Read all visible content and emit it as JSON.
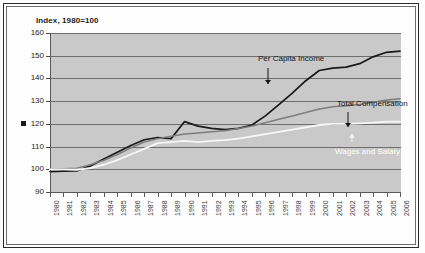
{
  "chart_data": {
    "type": "line",
    "title": "",
    "axis_title": "Index, 1980=100",
    "xlabel": "",
    "ylabel": "Index, 1980=100",
    "ylim": [
      90,
      160
    ],
    "ytick_step": 10,
    "yticks": [
      160,
      150,
      140,
      130,
      120,
      110,
      100,
      90
    ],
    "grid": true,
    "legend_position": "inline-annotations",
    "x": [
      1980,
      1981,
      1982,
      1983,
      1984,
      1985,
      1986,
      1987,
      1988,
      1989,
      1990,
      1991,
      1992,
      1993,
      1994,
      1995,
      1996,
      1997,
      1998,
      1999,
      2000,
      2001,
      2002,
      2003,
      2004,
      2005,
      2006
    ],
    "categories": [
      "1980",
      "1981",
      "1982",
      "1983",
      "1984",
      "1985",
      "1986",
      "1987",
      "1988",
      "1989",
      "1990",
      "1991",
      "1992",
      "1993",
      "1994",
      "1995",
      "1996",
      "1997",
      "1998",
      "1999",
      "2000",
      "2001",
      "2002",
      "2003",
      "2004",
      "2005",
      "2006"
    ],
    "series": [
      {
        "name": "Per Capita Income",
        "color": "#1a1a1a",
        "values": [
          99.0,
          99.2,
          99.3,
          101.5,
          104.5,
          107.5,
          110.5,
          113.0,
          114.0,
          113.5,
          121.0,
          119.0,
          118.0,
          117.5,
          118.0,
          119.5,
          123.5,
          128.5,
          133.5,
          139.0,
          143.5,
          144.5,
          145.0,
          146.5,
          149.5,
          151.5,
          152.0
        ]
      },
      {
        "name": "Total Compensation",
        "color": "#7d7d7d",
        "values": [
          100.0,
          100.2,
          100.5,
          102.0,
          104.0,
          106.5,
          109.5,
          112.0,
          113.5,
          114.5,
          115.5,
          116.0,
          116.5,
          117.0,
          118.0,
          119.0,
          120.5,
          122.0,
          123.5,
          125.0,
          126.5,
          127.5,
          128.0,
          128.5,
          129.5,
          130.5,
          131.0
        ]
      },
      {
        "name": "Wages and Salary",
        "color": "#f7f7f7",
        "values": [
          100.0,
          100.0,
          99.8,
          100.5,
          102.0,
          104.0,
          106.5,
          109.0,
          111.5,
          112.0,
          112.5,
          112.0,
          112.5,
          112.8,
          113.5,
          114.5,
          115.5,
          116.5,
          117.5,
          118.5,
          119.5,
          120.0,
          120.0,
          120.2,
          120.5,
          121.0,
          121.0
        ]
      }
    ],
    "annotations": [
      {
        "text": "Per Capita Income",
        "series": "Per Capita Income",
        "style": "dark"
      },
      {
        "text": "Total Compensation",
        "series": "Total Compensation",
        "style": "dark"
      },
      {
        "text": "Wages and Salary",
        "series": "Wages and Salary",
        "style": "white"
      }
    ]
  }
}
